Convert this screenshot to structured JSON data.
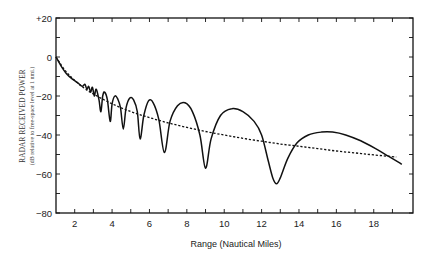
{
  "chart_data": {
    "type": "line",
    "title": "",
    "xlabel": "Range (Nautical Miles)",
    "ylabel": "RADAR RECEIVED POWER",
    "ylabel_sub": "(dB relative to free-space level at 1 nmi.)",
    "xlim": [
      1,
      20.1
    ],
    "ylim": [
      -80,
      20
    ],
    "x_ticks": [
      2,
      4,
      6,
      8,
      10,
      12,
      14,
      16,
      18
    ],
    "x_minor_ticks": [
      2,
      3,
      4,
      5,
      6,
      7,
      8,
      9,
      10,
      11,
      12,
      13,
      14,
      15,
      16,
      17,
      18,
      19
    ],
    "y_ticks": [
      20,
      0,
      -20,
      -40,
      -60,
      -80
    ],
    "y_tick_labels": [
      "+20",
      "0",
      "−20",
      "−40",
      "−60",
      "−80"
    ],
    "y_minor_ticks": [
      10,
      -10,
      -30,
      -50,
      -70
    ],
    "grid": false,
    "legend": null,
    "series": [
      {
        "name": "Received power with multipath (lobing)",
        "style": "solid",
        "points": [
          [
            1.0,
            0
          ],
          [
            1.3,
            -5
          ],
          [
            1.6,
            -9
          ],
          [
            1.9,
            -11.5
          ],
          [
            2.2,
            -13.5
          ],
          [
            2.4,
            -15
          ],
          [
            2.55,
            -14
          ],
          [
            2.65,
            -16.5
          ],
          [
            2.75,
            -15
          ],
          [
            2.85,
            -18
          ],
          [
            2.95,
            -15.5
          ],
          [
            3.05,
            -20
          ],
          [
            3.15,
            -16.5
          ],
          [
            3.3,
            -22
          ],
          [
            3.4,
            -28
          ],
          [
            3.5,
            -20
          ],
          [
            3.6,
            -18
          ],
          [
            3.75,
            -22
          ],
          [
            3.9,
            -33
          ],
          [
            4.0,
            -24
          ],
          [
            4.15,
            -20
          ],
          [
            4.3,
            -21.5
          ],
          [
            4.45,
            -26
          ],
          [
            4.6,
            -37
          ],
          [
            4.75,
            -26
          ],
          [
            4.95,
            -21
          ],
          [
            5.15,
            -22
          ],
          [
            5.35,
            -28
          ],
          [
            5.5,
            -42
          ],
          [
            5.7,
            -30
          ],
          [
            5.95,
            -22.5
          ],
          [
            6.2,
            -23.5
          ],
          [
            6.5,
            -32
          ],
          [
            6.8,
            -49
          ],
          [
            7.1,
            -33
          ],
          [
            7.5,
            -25
          ],
          [
            7.9,
            -23.5
          ],
          [
            8.3,
            -28
          ],
          [
            8.7,
            -40
          ],
          [
            9.0,
            -57
          ],
          [
            9.3,
            -42
          ],
          [
            9.8,
            -30
          ],
          [
            10.4,
            -26.5
          ],
          [
            11.0,
            -28
          ],
          [
            11.6,
            -33
          ],
          [
            12.0,
            -40
          ],
          [
            12.35,
            -53
          ],
          [
            12.6,
            -62
          ],
          [
            12.8,
            -65
          ],
          [
            13.0,
            -62
          ],
          [
            13.4,
            -52
          ],
          [
            13.9,
            -44
          ],
          [
            14.5,
            -40
          ],
          [
            15.2,
            -38.5
          ],
          [
            15.8,
            -38.5
          ],
          [
            16.5,
            -40
          ],
          [
            17.3,
            -43
          ],
          [
            18.1,
            -47
          ],
          [
            18.8,
            -51
          ],
          [
            19.5,
            -55
          ]
        ]
      },
      {
        "name": "Free-space level",
        "style": "dotted",
        "points": [
          [
            1.0,
            0
          ],
          [
            1.5,
            -7
          ],
          [
            2.0,
            -12
          ],
          [
            2.5,
            -15.9
          ],
          [
            3.0,
            -19
          ],
          [
            4.0,
            -24
          ],
          [
            5.0,
            -28
          ],
          [
            6.0,
            -31.1
          ],
          [
            7.0,
            -33.8
          ],
          [
            8.0,
            -36.1
          ],
          [
            9.0,
            -38.2
          ],
          [
            10.0,
            -40
          ],
          [
            11.0,
            -41.7
          ],
          [
            12.0,
            -43.2
          ],
          [
            13.0,
            -44.6
          ],
          [
            14.0,
            -45.8
          ],
          [
            15.0,
            -47
          ],
          [
            16.0,
            -48.2
          ],
          [
            17.0,
            -49.2
          ],
          [
            18.0,
            -50.2
          ],
          [
            19.2,
            -51.3
          ]
        ]
      }
    ]
  },
  "layout": {
    "plot_left": 56,
    "plot_top": 18,
    "plot_right": 413,
    "plot_bottom": 213,
    "line_color": "#111111"
  }
}
